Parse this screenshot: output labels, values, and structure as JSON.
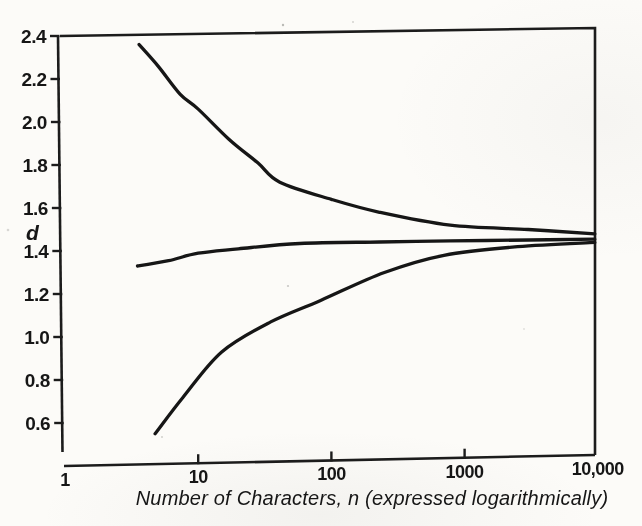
{
  "figure": {
    "ink_color": "#1c1c1c",
    "paper_color": "#fcfbf8"
  },
  "chart_data": {
    "type": "line",
    "title": "",
    "xlabel": "Number of Characters, n (expressed logarithmically)",
    "ylabel": "d",
    "x_scale": "log",
    "xlim": [
      1,
      10000
    ],
    "ylim": [
      0.5,
      2.4
    ],
    "grid": false,
    "legend": "none",
    "x_ticks": [
      {
        "label": "1",
        "n": 1
      },
      {
        "label": "10",
        "n": 10
      },
      {
        "label": "100",
        "n": 100
      },
      {
        "label": "1000",
        "n": 1000
      },
      {
        "label": "10,000",
        "n": 10000
      }
    ],
    "y_ticks": [
      {
        "label": "2.4",
        "d": 2.4
      },
      {
        "label": "2.2",
        "d": 2.2
      },
      {
        "label": "2.0",
        "d": 2.0
      },
      {
        "label": "1.8",
        "d": 1.8
      },
      {
        "label": "1.6",
        "d": 1.6
      },
      {
        "label": "1.4",
        "d": 1.4
      },
      {
        "label": "1.2",
        "d": 1.2
      },
      {
        "label": "1.0",
        "d": 1.0
      },
      {
        "label": "0.8",
        "d": 0.8
      },
      {
        "label": "0.6",
        "d": 0.6
      }
    ],
    "series": [
      {
        "name": "upper-curve",
        "points": [
          [
            3.6,
            2.36
          ],
          [
            5,
            2.26
          ],
          [
            7.3,
            2.13
          ],
          [
            10,
            2.06
          ],
          [
            17,
            1.92
          ],
          [
            28,
            1.81
          ],
          [
            41,
            1.72
          ],
          [
            100,
            1.64
          ],
          [
            230,
            1.58
          ],
          [
            780,
            1.52
          ],
          [
            3000,
            1.5
          ],
          [
            9500,
            1.48
          ]
        ]
      },
      {
        "name": "middle-curve",
        "points": [
          [
            3.5,
            1.33
          ],
          [
            6,
            1.355
          ],
          [
            10,
            1.39
          ],
          [
            20,
            1.41
          ],
          [
            58,
            1.435
          ],
          [
            230,
            1.442
          ],
          [
            780,
            1.447
          ],
          [
            3000,
            1.451
          ],
          [
            9500,
            1.455
          ]
        ]
      },
      {
        "name": "lower-curve",
        "points": [
          [
            4.75,
            0.55
          ],
          [
            7.7,
            0.72
          ],
          [
            15,
            0.93
          ],
          [
            35,
            1.07
          ],
          [
            83,
            1.17
          ],
          [
            250,
            1.3
          ],
          [
            700,
            1.38
          ],
          [
            2500,
            1.42
          ],
          [
            9500,
            1.44
          ]
        ]
      }
    ]
  }
}
